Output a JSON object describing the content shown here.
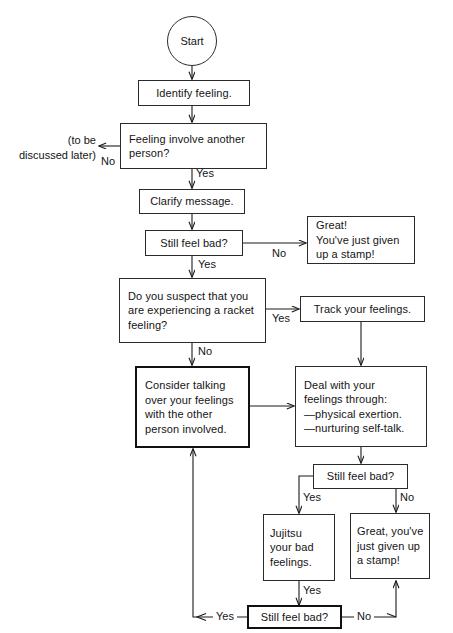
{
  "meta": {
    "width": 453,
    "height": 633,
    "ink_color": "#1a1a1a",
    "paper_color": "#ffffff"
  },
  "nodes": {
    "start": "Start",
    "identify_feeling": "Identify feeling.",
    "feeling_involve_another": "Feeling involve another\nperson?",
    "clarify_message": "Clarify message.",
    "still_feel_bad_1": "Still feel bad?",
    "great_given_up_stamp_1": "Great!\nYou've just given\nup a stamp!",
    "racket_feeling": "Do you suspect that you\nare experiencing a racket\nfeeling?",
    "track_your_feelings": "Track your feelings.",
    "consider_talking": "Consider talking\nover your feelings\nwith the other\nperson involved.",
    "deal_with_feelings": "Deal with your\nfeelings through:\n—physical exertion.\n—nurturing self-talk.",
    "still_feel_bad_2": "Still feel bad?",
    "jujitsu": "Jujitsu\nyour bad\nfeelings.",
    "great_given_up_stamp_2": "Great, you've\njust given up\na stamp!",
    "still_feel_bad_3": "Still feel bad?"
  },
  "edge_labels": {
    "no_involve_another": "No",
    "yes_involve_another": "Yes",
    "no_still_bad_1": "No",
    "yes_still_bad_1": "Yes",
    "yes_racket": "Yes",
    "no_racket": "No",
    "yes_still_bad_2": "Yes",
    "no_still_bad_2": "No",
    "yes_jujitsu": "Yes",
    "yes_still_bad_3": "Yes",
    "no_still_bad_3": "No"
  },
  "annotations": {
    "to_be_discussed_later": "(to be\ndiscussed later)"
  }
}
